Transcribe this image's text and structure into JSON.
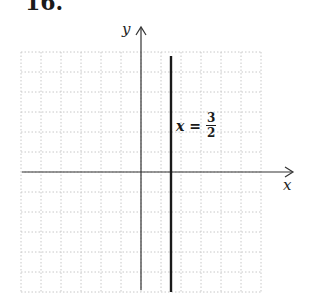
{
  "problem": {
    "number": "16."
  },
  "chart_data": {
    "type": "line",
    "title": "",
    "xlabel": "x",
    "ylabel": "y",
    "xlim": [
      -6,
      6
    ],
    "ylim": [
      -6,
      6
    ],
    "grid": true,
    "grid_style": "dotted",
    "series": [
      {
        "name": "x = 3/2",
        "kind": "vertical_line",
        "x": 1.5,
        "y_range": [
          -6,
          5.8
        ],
        "color": "#1a1a1a"
      }
    ],
    "annotations": [
      {
        "text": "x = 3/2",
        "x": 1.7,
        "y": 2.4
      }
    ]
  },
  "labels": {
    "x_axis": "x",
    "y_axis": "y",
    "equation_lhs": "x",
    "equation_eq": "=",
    "frac_num": "3",
    "frac_den": "2"
  },
  "colors": {
    "axis": "#333333",
    "grid": "#c8c8c8",
    "line": "#1a1a1a"
  }
}
